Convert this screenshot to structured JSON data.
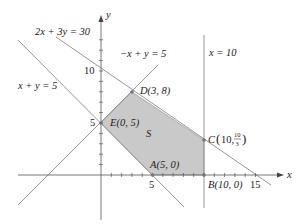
{
  "diagram": {
    "type": "feasible-region",
    "axes": {
      "x_label": "x",
      "y_label": "y",
      "x_ticks": [
        "5",
        "10",
        "15"
      ],
      "y_ticks": [
        "5",
        "10"
      ]
    },
    "lines": [
      {
        "equation": "2x + 3y = 30"
      },
      {
        "equation": "−x + y = 5"
      },
      {
        "equation": "x + y = 5"
      },
      {
        "equation": "x = 10"
      }
    ],
    "region_label": "S",
    "vertices": {
      "A": {
        "label": "A(5, 0)"
      },
      "B": {
        "label": "B(10, 0)"
      },
      "C": {
        "label_prefix": "C",
        "label_x": "10,",
        "frac_num": "10",
        "frac_den": "3"
      },
      "D": {
        "label": "D(3, 8)"
      },
      "E": {
        "label": "E(0, 5)"
      }
    },
    "colors": {
      "region_fill": "#c9c9c9",
      "line": "#8a8a8a",
      "axis": "#555555"
    }
  }
}
